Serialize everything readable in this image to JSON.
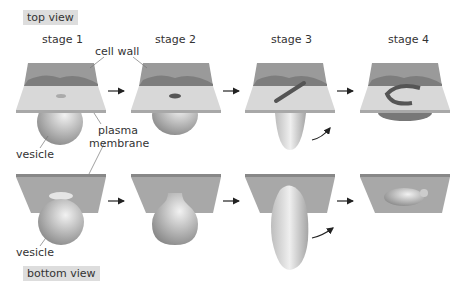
{
  "labels": {
    "top_view": "top view",
    "bottom_view": "bottom view",
    "stages": [
      "stage 1",
      "stage 2",
      "stage 3",
      "stage 4"
    ],
    "cell_wall": "cell wall",
    "plasma": "plasma",
    "membrane": "membrane",
    "vesicle_top": "vesicle",
    "vesicle_bottom": "vesicle"
  },
  "colors": {
    "wall": "#9a9a9a",
    "wall_edge": "#7d7d7d",
    "membrane_top": "#d8d8d8",
    "membrane_bottom": "#a8a8a8",
    "label_bg": "#dddddd"
  }
}
